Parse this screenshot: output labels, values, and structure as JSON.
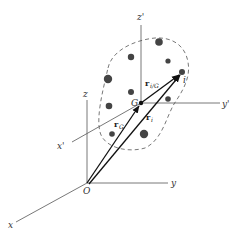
{
  "figure": {
    "fixed_frame": {
      "origin_label": "O",
      "axes": [
        {
          "name": "x",
          "label": "x"
        },
        {
          "name": "y",
          "label": "y"
        },
        {
          "name": "z",
          "label": "z"
        }
      ]
    },
    "moving_frame": {
      "origin_label": "G",
      "axes": [
        {
          "name": "x'",
          "label": "x'"
        },
        {
          "name": "y'",
          "label": "y'"
        },
        {
          "name": "z'",
          "label": "z'"
        }
      ]
    },
    "particle_label": "i",
    "vectors": [
      {
        "id": "rG",
        "main": "r",
        "sub": "G",
        "from": "O",
        "to": "G"
      },
      {
        "id": "ri",
        "main": "r",
        "sub": "i",
        "from": "O",
        "to": "i"
      },
      {
        "id": "ri_G",
        "main": "r",
        "sub": "i/G",
        "from": "G",
        "to": "i"
      }
    ],
    "boundary": "dashed closed curve enclosing particles",
    "particle_count": 10,
    "colors": {
      "line": "#555555",
      "vector": "#111111",
      "particle": "#444444"
    }
  }
}
